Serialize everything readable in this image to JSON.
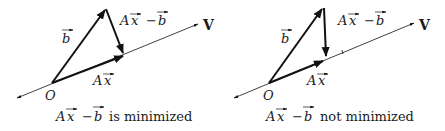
{
  "panels": [
    {
      "id": "left",
      "caption_expr": "Ax − b",
      "caption_text": "is minimized",
      "labels": {
        "b": "b",
        "diff_A": "A",
        "diff_x": "x",
        "diff_minus": "−",
        "diff_b": "b",
        "ax_A": "A",
        "ax_x": "x",
        "origin": "O",
        "line": "V"
      }
    },
    {
      "id": "right",
      "caption_expr": "Ax − b",
      "caption_text": "not minimized",
      "labels": {
        "b": "b",
        "diff_A": "A",
        "diff_x": "x",
        "diff_minus": "−",
        "diff_b": "b",
        "ax_A": "A",
        "ax_x": "x",
        "origin": "O",
        "line": "V"
      }
    }
  ],
  "colors": {
    "stroke": "#111111",
    "text": "#1a1a1a"
  }
}
